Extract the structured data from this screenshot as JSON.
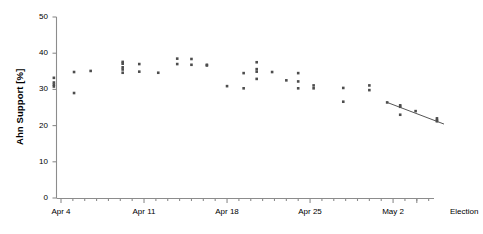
{
  "chart_data": {
    "type": "scatter",
    "title": "",
    "xlabel": "",
    "ylabel": "Ahn Support [%]",
    "ylim": [
      0,
      50
    ],
    "yticks": [
      0,
      10,
      20,
      30,
      40,
      50
    ],
    "ytick_labels": [
      "0",
      "10",
      "20",
      "30",
      "40",
      "50"
    ],
    "xtick_labels": [
      "Apr 4",
      "Apr 11",
      "Apr 18",
      "Apr 25",
      "May 2",
      "Election"
    ],
    "xtick_days": [
      0,
      7,
      14,
      21,
      28,
      30
    ],
    "x_minor_tick_interval_days": 1,
    "grid": false,
    "legend": null,
    "marker": "square",
    "marker_color": "#4d4d4d",
    "axis_color": "#8c8c8c",
    "text_color": "#000000",
    "trendline": {
      "label": "linear fit",
      "color": "#555555",
      "x_start_day": 21,
      "x_end_day": 31.6,
      "y_start": 26.4,
      "y_end": 16.3
    },
    "election_marker": {
      "label": "election result",
      "symbol": "star",
      "x_day": 30,
      "y": 22.3
    },
    "election_estimate": {
      "label": "final estimate with 95% CI",
      "x_day": 30,
      "y": 16.1,
      "y_low": 14.2,
      "y_high": 19.4,
      "color": "#9a9a9a"
    },
    "points": [
      {
        "x": -0.6,
        "y": 33.2
      },
      {
        "x": -0.6,
        "y": 31.9
      },
      {
        "x": -0.6,
        "y": 31.3
      },
      {
        "x": -0.6,
        "y": 30.8
      },
      {
        "x": 1.1,
        "y": 34.8
      },
      {
        "x": 1.1,
        "y": 29.0
      },
      {
        "x": 2.5,
        "y": 35.1
      },
      {
        "x": 5.2,
        "y": 37.6
      },
      {
        "x": 5.2,
        "y": 37.1
      },
      {
        "x": 5.2,
        "y": 36.1
      },
      {
        "x": 5.2,
        "y": 35.5
      },
      {
        "x": 5.2,
        "y": 34.6
      },
      {
        "x": 6.6,
        "y": 37.0
      },
      {
        "x": 6.6,
        "y": 34.9
      },
      {
        "x": 8.2,
        "y": 34.6
      },
      {
        "x": 9.8,
        "y": 37.0
      },
      {
        "x": 9.8,
        "y": 38.5
      },
      {
        "x": 11.0,
        "y": 38.4
      },
      {
        "x": 11.0,
        "y": 36.8
      },
      {
        "x": 12.3,
        "y": 36.8
      },
      {
        "x": 12.3,
        "y": 36.6
      },
      {
        "x": 14.0,
        "y": 30.9
      },
      {
        "x": 15.4,
        "y": 34.5
      },
      {
        "x": 15.4,
        "y": 30.3
      },
      {
        "x": 16.5,
        "y": 37.5
      },
      {
        "x": 16.5,
        "y": 35.6
      },
      {
        "x": 16.5,
        "y": 34.9
      },
      {
        "x": 16.5,
        "y": 32.9
      },
      {
        "x": 17.8,
        "y": 34.8
      },
      {
        "x": 19.0,
        "y": 32.5
      },
      {
        "x": 20.0,
        "y": 34.5
      },
      {
        "x": 20.0,
        "y": 32.2
      },
      {
        "x": 20.0,
        "y": 30.3
      },
      {
        "x": 21.3,
        "y": 31.1
      },
      {
        "x": 21.3,
        "y": 30.3
      },
      {
        "x": 23.8,
        "y": 30.4
      },
      {
        "x": 23.8,
        "y": 26.6
      },
      {
        "x": 26.0,
        "y": 31.1
      },
      {
        "x": 26.0,
        "y": 29.8
      },
      {
        "x": 27.5,
        "y": 26.4
      },
      {
        "x": 28.6,
        "y": 25.6
      },
      {
        "x": 28.6,
        "y": 25.2
      },
      {
        "x": 28.6,
        "y": 23.0
      },
      {
        "x": 29.9,
        "y": 24.0
      },
      {
        "x": 31.7,
        "y": 22.0
      },
      {
        "x": 31.7,
        "y": 21.5
      },
      {
        "x": 31.7,
        "y": 21.2
      },
      {
        "x": 32.9,
        "y": 23.6
      },
      {
        "x": 32.9,
        "y": 21.0
      },
      {
        "x": 32.9,
        "y": 20.0
      },
      {
        "x": 32.9,
        "y": 19.6
      },
      {
        "x": 34.0,
        "y": 24.1
      },
      {
        "x": 34.0,
        "y": 22.4
      },
      {
        "x": 34.0,
        "y": 22.1
      },
      {
        "x": 34.0,
        "y": 21.7
      },
      {
        "x": 34.0,
        "y": 20.0
      },
      {
        "x": 34.0,
        "y": 19.6
      },
      {
        "x": 35.1,
        "y": 21.6
      },
      {
        "x": 35.1,
        "y": 21.1
      },
      {
        "x": 35.1,
        "y": 20.6
      },
      {
        "x": 35.1,
        "y": 20.0
      },
      {
        "x": 35.1,
        "y": 19.4
      },
      {
        "x": 35.1,
        "y": 18.7
      },
      {
        "x": 35.1,
        "y": 18.1
      },
      {
        "x": 35.1,
        "y": 16.0
      }
    ]
  }
}
